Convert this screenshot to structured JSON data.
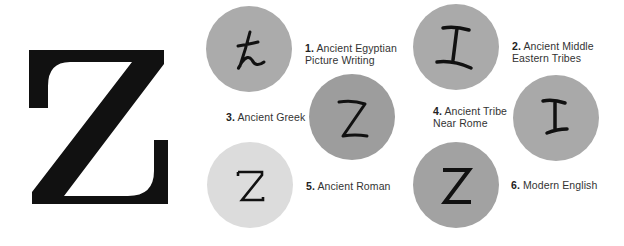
{
  "title_letter": "Z",
  "colors": {
    "big_letter": "#111111",
    "circle_medium": "#a8a8a8",
    "circle_dark": "#9a9a9a",
    "circle_light": "#dedede",
    "glyph": "#111111",
    "label_text": "#333333"
  },
  "stages": [
    {
      "number": "1.",
      "line1": "Ancient Egyptian",
      "line2": "Picture Writing",
      "glyph": "egyptian-snake-glyph"
    },
    {
      "number": "2.",
      "line1": "Ancient Middle",
      "line2": "Eastern Tribes",
      "glyph": "zayin-glyph"
    },
    {
      "number": "3.",
      "line1": "Ancient Greek",
      "line2": "",
      "glyph": "greek-zeta-glyph"
    },
    {
      "number": "4.",
      "line1": "Ancient Tribe",
      "line2": "Near Rome",
      "glyph": "etruscan-glyph"
    },
    {
      "number": "5.",
      "line1": "Ancient Roman",
      "line2": "",
      "glyph": "roman-z-glyph"
    },
    {
      "number": "6.",
      "line1": "Modern English",
      "line2": "",
      "glyph": "modern-z-glyph"
    }
  ]
}
